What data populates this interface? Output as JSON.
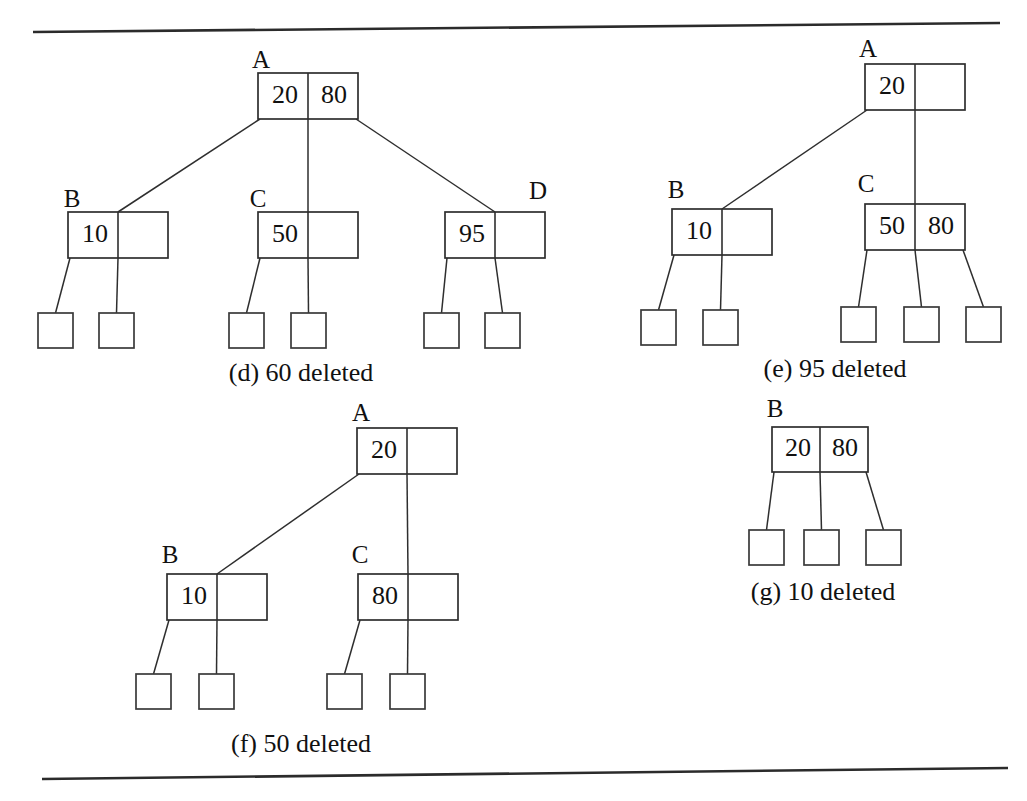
{
  "figure": {
    "background_color": "#ffffff",
    "ink_color": "#2e2e2e",
    "top_rule": {
      "x1": 33,
      "y1": 32,
      "x2": 1000,
      "y2": 23
    },
    "bottom_rule": {
      "x1": 42,
      "y1": 779,
      "x2": 1008,
      "y2": 768
    }
  },
  "panels": [
    {
      "id": "panel-d",
      "caption": "(d) 60 deleted",
      "caption_x": 301,
      "caption_y": 381,
      "nodes": [
        {
          "name": "A",
          "label": "A",
          "label_x": 261,
          "label_y": 68,
          "x": 258,
          "y": 73,
          "w": 100,
          "h": 46,
          "keys": [
            "20",
            "80"
          ],
          "children_indices": [
            1,
            2,
            3
          ]
        },
        {
          "name": "B",
          "label": "B",
          "label_x": 72,
          "label_y": 207,
          "x": 68,
          "y": 212,
          "w": 100,
          "h": 46,
          "keys": [
            "10",
            ""
          ],
          "children_indices": [
            4,
            5
          ]
        },
        {
          "name": "C",
          "label": "C",
          "label_x": 258,
          "label_y": 207,
          "x": 258,
          "y": 212,
          "w": 100,
          "h": 46,
          "keys": [
            "50",
            ""
          ],
          "children_indices": [
            6,
            7
          ]
        },
        {
          "name": "D",
          "label": "D",
          "label_x": 538,
          "label_y": 199,
          "x": 445,
          "y": 212,
          "w": 100,
          "h": 46,
          "keys": [
            "95",
            ""
          ],
          "children_indices": [
            8,
            9
          ]
        },
        {
          "name": "leaf",
          "label": "",
          "x": 38,
          "y": 313,
          "w": 35,
          "h": 35,
          "keys": [],
          "leaf": true
        },
        {
          "name": "leaf",
          "label": "",
          "x": 99,
          "y": 313,
          "w": 35,
          "h": 35,
          "keys": [],
          "leaf": true
        },
        {
          "name": "leaf",
          "label": "",
          "x": 229,
          "y": 313,
          "w": 35,
          "h": 35,
          "keys": [],
          "leaf": true
        },
        {
          "name": "leaf",
          "label": "",
          "x": 291,
          "y": 313,
          "w": 35,
          "h": 35,
          "keys": [],
          "leaf": true
        },
        {
          "name": "leaf",
          "label": "",
          "x": 424,
          "y": 313,
          "w": 35,
          "h": 35,
          "keys": [],
          "leaf": true
        },
        {
          "name": "leaf",
          "label": "",
          "x": 485,
          "y": 313,
          "w": 35,
          "h": 35,
          "keys": [],
          "leaf": true
        }
      ]
    },
    {
      "id": "panel-e",
      "caption": "(e) 95 deleted",
      "caption_x": 835,
      "caption_y": 377,
      "nodes": [
        {
          "name": "A",
          "label": "A",
          "label_x": 868,
          "label_y": 57,
          "x": 865,
          "y": 64,
          "w": 100,
          "h": 46,
          "keys": [
            "20",
            ""
          ],
          "children_indices": [
            1,
            2
          ]
        },
        {
          "name": "B",
          "label": "B",
          "label_x": 676,
          "label_y": 198,
          "x": 672,
          "y": 209,
          "w": 100,
          "h": 46,
          "keys": [
            "10",
            ""
          ],
          "children_indices": [
            3,
            4
          ]
        },
        {
          "name": "C",
          "label": "C",
          "label_x": 866,
          "label_y": 192,
          "x": 865,
          "y": 204,
          "w": 100,
          "h": 46,
          "keys": [
            "50",
            "80"
          ],
          "children_indices": [
            5,
            6,
            7
          ]
        },
        {
          "name": "leaf",
          "label": "",
          "x": 641,
          "y": 310,
          "w": 35,
          "h": 35,
          "keys": [],
          "leaf": true
        },
        {
          "name": "leaf",
          "label": "",
          "x": 703,
          "y": 310,
          "w": 35,
          "h": 35,
          "keys": [],
          "leaf": true
        },
        {
          "name": "leaf",
          "label": "",
          "x": 841,
          "y": 307,
          "w": 35,
          "h": 35,
          "keys": [],
          "leaf": true
        },
        {
          "name": "leaf",
          "label": "",
          "x": 904,
          "y": 307,
          "w": 35,
          "h": 35,
          "keys": [],
          "leaf": true
        },
        {
          "name": "leaf",
          "label": "",
          "x": 966,
          "y": 307,
          "w": 35,
          "h": 35,
          "keys": [],
          "leaf": true
        }
      ]
    },
    {
      "id": "panel-f",
      "caption": "(f) 50 deleted",
      "caption_x": 301,
      "caption_y": 752,
      "nodes": [
        {
          "name": "A",
          "label": "A",
          "label_x": 361,
          "label_y": 421,
          "x": 357,
          "y": 428,
          "w": 100,
          "h": 46,
          "keys": [
            "20",
            ""
          ],
          "children_indices": [
            1,
            2
          ]
        },
        {
          "name": "B",
          "label": "B",
          "label_x": 170,
          "label_y": 563,
          "x": 167,
          "y": 574,
          "w": 100,
          "h": 46,
          "keys": [
            "10",
            ""
          ],
          "children_indices": [
            3,
            4
          ]
        },
        {
          "name": "C",
          "label": "C",
          "label_x": 360,
          "label_y": 563,
          "x": 358,
          "y": 574,
          "w": 100,
          "h": 46,
          "keys": [
            "80",
            ""
          ],
          "children_indices": [
            5,
            6
          ]
        },
        {
          "name": "leaf",
          "label": "",
          "x": 136,
          "y": 674,
          "w": 35,
          "h": 35,
          "keys": [],
          "leaf": true
        },
        {
          "name": "leaf",
          "label": "",
          "x": 199,
          "y": 674,
          "w": 35,
          "h": 35,
          "keys": [],
          "leaf": true
        },
        {
          "name": "leaf",
          "label": "",
          "x": 327,
          "y": 674,
          "w": 35,
          "h": 35,
          "keys": [],
          "leaf": true
        },
        {
          "name": "leaf",
          "label": "",
          "x": 390,
          "y": 674,
          "w": 35,
          "h": 35,
          "keys": [],
          "leaf": true
        }
      ]
    },
    {
      "id": "panel-g",
      "caption": "(g) 10 deleted",
      "caption_x": 823,
      "caption_y": 600,
      "nodes": [
        {
          "name": "B",
          "label": "B",
          "label_x": 775,
          "label_y": 417,
          "x": 772,
          "y": 427,
          "w": 96,
          "h": 45,
          "keys": [
            "20",
            "80"
          ],
          "children_indices": [
            1,
            2,
            3
          ]
        },
        {
          "name": "leaf",
          "label": "",
          "x": 749,
          "y": 530,
          "w": 35,
          "h": 35,
          "keys": [],
          "leaf": true
        },
        {
          "name": "leaf",
          "label": "",
          "x": 804,
          "y": 530,
          "w": 35,
          "h": 35,
          "keys": [],
          "leaf": true
        },
        {
          "name": "leaf",
          "label": "",
          "x": 866,
          "y": 530,
          "w": 35,
          "h": 35,
          "keys": [],
          "leaf": true
        }
      ]
    }
  ]
}
